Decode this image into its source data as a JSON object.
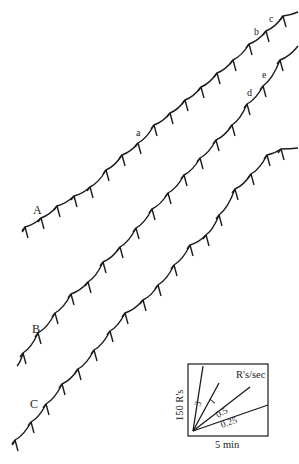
{
  "figure": {
    "type": "cumulative_record",
    "curves": [
      {
        "label": "A",
        "label_pos": [
          33,
          214
        ],
        "points": [
          [
            22,
            232
          ],
          [
            25,
            227
          ],
          [
            41,
            218
          ],
          [
            57,
            206
          ],
          [
            74,
            196
          ],
          [
            90,
            187
          ],
          [
            106,
            170
          ],
          [
            122,
            155
          ],
          [
            138,
            143
          ],
          [
            154,
            125
          ],
          [
            170,
            113
          ],
          [
            185,
            100
          ],
          [
            201,
            87
          ],
          [
            217,
            73
          ],
          [
            233,
            60
          ],
          [
            249,
            44
          ],
          [
            266,
            31
          ],
          [
            283,
            16
          ],
          [
            298,
            12
          ]
        ],
        "annotations": [
          {
            "text": "a",
            "pos": [
              136,
              136
            ]
          },
          {
            "text": "b",
            "pos": [
              254,
              35
            ]
          },
          {
            "text": "c",
            "pos": [
              269,
              22
            ]
          }
        ]
      },
      {
        "label": "B",
        "label_pos": [
          32,
          333
        ],
        "points": [
          [
            17,
            366
          ],
          [
            23,
            353
          ],
          [
            38,
            333
          ],
          [
            55,
            313
          ],
          [
            71,
            294
          ],
          [
            88,
            282
          ],
          [
            103,
            262
          ],
          [
            120,
            247
          ],
          [
            136,
            228
          ],
          [
            152,
            209
          ],
          [
            168,
            193
          ],
          [
            184,
            175
          ],
          [
            200,
            158
          ],
          [
            216,
            140
          ],
          [
            232,
            125
          ],
          [
            247,
            104
          ],
          [
            263,
            86
          ],
          [
            280,
            60
          ],
          [
            298,
            46
          ]
        ],
        "annotations": [
          {
            "text": "d",
            "pos": [
              247,
              96
            ]
          },
          {
            "text": "e",
            "pos": [
              262,
              78
            ]
          }
        ]
      },
      {
        "label": "C",
        "label_pos": [
          30,
          408
        ],
        "points": [
          [
            12,
            445
          ],
          [
            15,
            440
          ],
          [
            31,
            422
          ],
          [
            46,
            404
          ],
          [
            62,
            384
          ],
          [
            78,
            369
          ],
          [
            94,
            350
          ],
          [
            110,
            331
          ],
          [
            125,
            313
          ],
          [
            143,
            300
          ],
          [
            158,
            285
          ],
          [
            174,
            265
          ],
          [
            190,
            245
          ],
          [
            206,
            235
          ],
          [
            219,
            215
          ],
          [
            235,
            189
          ],
          [
            251,
            174
          ],
          [
            267,
            155
          ],
          [
            281,
            149
          ],
          [
            298,
            148
          ]
        ],
        "annotations": []
      }
    ],
    "legend": {
      "box": [
        188,
        364,
        80,
        72
      ],
      "title": "R's/sec",
      "y_label": "150 R's",
      "x_label": "5 min",
      "rates": [
        {
          "label": "3",
          "end": [
            203,
            366
          ]
        },
        {
          "label": "1",
          "end": [
            219,
            383
          ]
        },
        {
          "label": "0.5",
          "end": [
            250,
            387
          ]
        },
        {
          "label": "0.25",
          "end": [
            268,
            405
          ]
        }
      ]
    }
  }
}
